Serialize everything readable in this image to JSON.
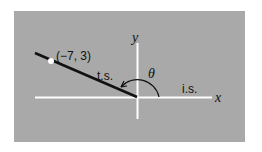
{
  "diagram": {
    "panel_color": "#a9a9a9",
    "axes": {
      "x_label": "x",
      "y_label": "y",
      "color": "#ffffff"
    },
    "point": {
      "label": "(−7, 3)",
      "x": -7,
      "y": 3,
      "color": "#ffffff"
    },
    "terminal_side": {
      "label": "t.s.",
      "color": "#111111"
    },
    "initial_side": {
      "label": "i.s."
    },
    "angle": {
      "label": "θ"
    }
  }
}
